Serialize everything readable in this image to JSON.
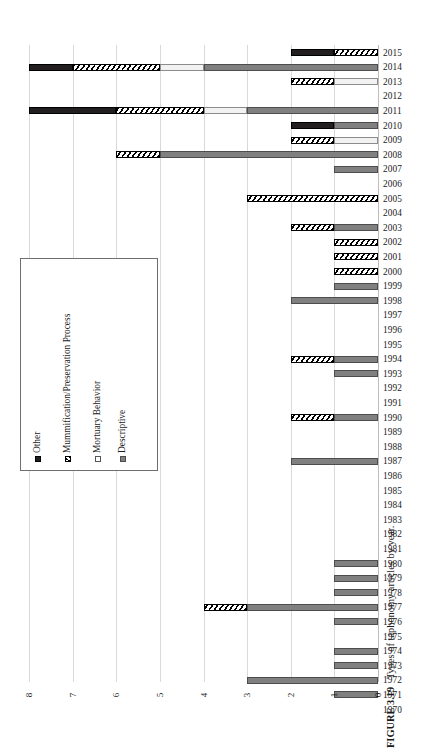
{
  "figure": {
    "number": "FIGURE 3.19",
    "caption": "Types of taphonomy articles by year."
  },
  "axis": {
    "x_ticks": [
      "8",
      "7",
      "6",
      "5",
      "4",
      "3",
      "2",
      "1",
      "0"
    ],
    "x_tick_values": [
      8,
      7,
      6,
      5,
      4,
      3,
      2,
      1,
      0
    ]
  },
  "legend": {
    "items": [
      {
        "label": "Other",
        "key": "other"
      },
      {
        "label": "Mummification/Preservation Process",
        "key": "mummy"
      },
      {
        "label": "Mortuary Behavior",
        "key": "mortuary"
      },
      {
        "label": "Descriptive",
        "key": "descriptive"
      }
    ]
  },
  "chart_data": {
    "type": "bar",
    "orientation": "horizontal",
    "stacked": true,
    "title": "Types of taphonomy articles by year.",
    "xlabel": "",
    "ylabel": "",
    "xlim": [
      0,
      8
    ],
    "x_axis_reversed": true,
    "grid": true,
    "legend_position": "inside-left",
    "categories": [
      "2015",
      "2014",
      "2013",
      "2012",
      "2011",
      "2010",
      "2009",
      "2008",
      "2007",
      "2006",
      "2005",
      "2004",
      "2003",
      "2002",
      "2001",
      "2000",
      "1999",
      "1998",
      "1997",
      "1996",
      "1995",
      "1994",
      "1993",
      "1992",
      "1991",
      "1990",
      "1989",
      "1988",
      "1987",
      "1986",
      "1985",
      "1984",
      "1983",
      "1982",
      "1981",
      "1980",
      "1979",
      "1978",
      "1977",
      "1976",
      "1975",
      "1974",
      "1973",
      "1972",
      "1971",
      "1970"
    ],
    "series": [
      {
        "name": "Other",
        "key": "other",
        "values": [
          1,
          1,
          0,
          0,
          2,
          1,
          0,
          0,
          0,
          0,
          0,
          0,
          0,
          0,
          0,
          0,
          0,
          0,
          0,
          0,
          0,
          0,
          0,
          0,
          0,
          0,
          0,
          0,
          0,
          0,
          0,
          0,
          0,
          0,
          0,
          0,
          0,
          0,
          0,
          0,
          0,
          0,
          0,
          0,
          0,
          0
        ]
      },
      {
        "name": "Mummification/Preservation Process",
        "key": "mummy",
        "values": [
          1,
          2,
          1,
          0,
          2,
          0,
          1,
          1,
          0,
          0,
          3,
          0,
          1,
          1,
          1,
          1,
          0,
          0,
          0,
          0,
          0,
          1,
          0,
          0,
          0,
          1,
          0,
          0,
          0,
          0,
          0,
          0,
          0,
          0,
          0,
          0,
          0,
          0,
          1,
          0,
          0,
          0,
          0,
          0,
          0,
          0
        ]
      },
      {
        "name": "Mortuary Behavior",
        "key": "mortuary",
        "values": [
          0,
          1,
          1,
          0,
          1,
          0,
          1,
          0,
          0,
          0,
          0,
          0,
          0,
          0,
          0,
          0,
          0,
          0,
          0,
          0,
          0,
          0,
          0,
          0,
          0,
          0,
          0,
          0,
          0,
          0,
          0,
          0,
          0,
          0,
          0,
          0,
          0,
          0,
          0,
          0,
          0,
          0,
          0,
          0,
          0,
          0
        ]
      },
      {
        "name": "Descriptive",
        "key": "descriptive",
        "values": [
          0,
          4,
          0,
          0,
          3,
          1,
          0,
          5,
          1,
          0,
          0,
          0,
          1,
          0,
          0,
          0,
          1,
          2,
          0,
          0,
          0,
          1,
          1,
          0,
          0,
          1,
          0,
          0,
          2,
          0,
          0,
          0,
          0,
          0,
          0,
          1,
          1,
          1,
          3,
          1,
          0,
          1,
          1,
          3,
          1,
          0
        ]
      }
    ],
    "totals": [
      2,
      8,
      2,
      0,
      8,
      2,
      2,
      6,
      1,
      0,
      3,
      0,
      2,
      1,
      1,
      1,
      1,
      2,
      0,
      0,
      0,
      2,
      1,
      0,
      0,
      2,
      0,
      0,
      2,
      0,
      0,
      0,
      0,
      0,
      0,
      1,
      1,
      1,
      4,
      1,
      0,
      1,
      1,
      3,
      1,
      0
    ]
  }
}
